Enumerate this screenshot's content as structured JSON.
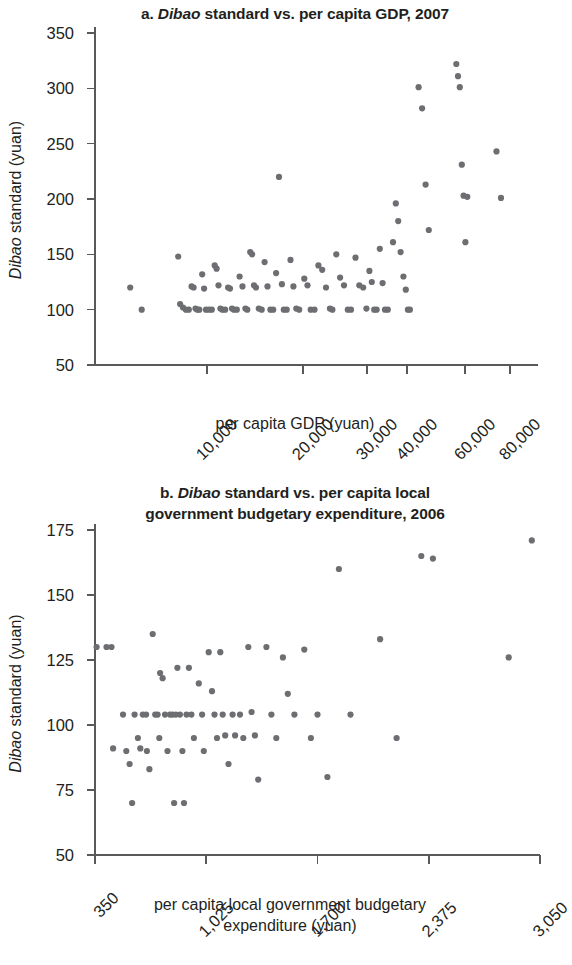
{
  "figure": {
    "background": "#ffffff",
    "marker_color": "#6d6e71",
    "axis_color": "#58595b",
    "text_color": "#231f20"
  },
  "panel_a": {
    "title_prefix": "a. ",
    "title_italic": "Dibao",
    "title_rest": " standard vs. per capita GDP, 2007",
    "title_full": "a. Dibao standard vs. per capita GDP, 2007",
    "y_axis_title_italic": "Dibao",
    "y_axis_title_rest": " standard (yuan)",
    "x_axis_title": "per capita GDP (yuan)"
  },
  "panel_b": {
    "title_prefix": "b. ",
    "title_italic": "Dibao",
    "title_rest_line1": " standard vs. per capita local",
    "title_line2": "government budgetary expenditure, 2006",
    "title_full": "b. Dibao standard vs. per capita local government budgetary expenditure, 2006",
    "y_axis_title_italic": "Dibao",
    "y_axis_title_rest": " standard (yuan)",
    "x_axis_title_line1": "per capita local government budgetary",
    "x_axis_title_line2": "expenditure (yuan)"
  },
  "chart_data": [
    {
      "id": "chart-a",
      "type": "scatter",
      "title": "a. Dibao standard vs. per capita GDP, 2007",
      "xlabel": "per capita GDP (yuan)",
      "ylabel": "Dibao standard (yuan)",
      "grid": false,
      "legend": "none",
      "ylim": [
        50,
        350
      ],
      "yticks": [
        50,
        100,
        150,
        200,
        250,
        300,
        350
      ],
      "xticks": [
        10000,
        20000,
        30000,
        40000,
        60000,
        80000
      ],
      "xtick_labels": [
        "10,000",
        "20,000",
        "30,000",
        "40,000",
        "60,000",
        "80,000"
      ],
      "xtick_pixels": [
        207,
        303,
        367,
        407,
        465,
        510
      ],
      "x_axis_note": "non-linear compressed axis; tick spacing decreases at high values",
      "points": [
        [
          2000,
          120
        ],
        [
          3200,
          100
        ],
        [
          7000,
          148
        ],
        [
          7200,
          105
        ],
        [
          7500,
          102
        ],
        [
          7800,
          100
        ],
        [
          8100,
          100
        ],
        [
          8400,
          121
        ],
        [
          8600,
          120
        ],
        [
          8800,
          101
        ],
        [
          9000,
          100
        ],
        [
          9200,
          100
        ],
        [
          9500,
          132
        ],
        [
          9700,
          119
        ],
        [
          9900,
          100
        ],
        [
          10200,
          100
        ],
        [
          10500,
          100
        ],
        [
          10800,
          140
        ],
        [
          11000,
          137
        ],
        [
          11200,
          122
        ],
        [
          11400,
          101
        ],
        [
          11600,
          100
        ],
        [
          11900,
          100
        ],
        [
          12200,
          120
        ],
        [
          12400,
          119
        ],
        [
          12600,
          101
        ],
        [
          12800,
          100
        ],
        [
          13100,
          100
        ],
        [
          13400,
          130
        ],
        [
          13700,
          121
        ],
        [
          14000,
          101
        ],
        [
          14200,
          100
        ],
        [
          14500,
          152
        ],
        [
          14700,
          150
        ],
        [
          14900,
          122
        ],
        [
          15100,
          120
        ],
        [
          15400,
          101
        ],
        [
          15700,
          100
        ],
        [
          16000,
          143
        ],
        [
          16300,
          121
        ],
        [
          16600,
          100
        ],
        [
          16900,
          100
        ],
        [
          17200,
          133
        ],
        [
          17500,
          220
        ],
        [
          17800,
          123
        ],
        [
          18000,
          100
        ],
        [
          18300,
          100
        ],
        [
          18700,
          145
        ],
        [
          19000,
          121
        ],
        [
          19300,
          101
        ],
        [
          19600,
          100
        ],
        [
          20200,
          128
        ],
        [
          20700,
          122
        ],
        [
          21200,
          100
        ],
        [
          21800,
          100
        ],
        [
          22400,
          140
        ],
        [
          23000,
          136
        ],
        [
          23600,
          120
        ],
        [
          24200,
          101
        ],
        [
          24600,
          100
        ],
        [
          25200,
          150
        ],
        [
          25800,
          129
        ],
        [
          26400,
          122
        ],
        [
          27000,
          100
        ],
        [
          27500,
          100
        ],
        [
          28200,
          147
        ],
        [
          28800,
          122
        ],
        [
          29400,
          120
        ],
        [
          29900,
          101
        ],
        [
          30600,
          135
        ],
        [
          31200,
          125
        ],
        [
          31800,
          100
        ],
        [
          32400,
          100
        ],
        [
          33200,
          155
        ],
        [
          33900,
          124
        ],
        [
          34500,
          100
        ],
        [
          35200,
          100
        ],
        [
          36500,
          161
        ],
        [
          37200,
          196
        ],
        [
          37800,
          180
        ],
        [
          38400,
          152
        ],
        [
          39100,
          130
        ],
        [
          39700,
          118
        ],
        [
          40300,
          100
        ],
        [
          41000,
          100
        ],
        [
          44000,
          301
        ],
        [
          45200,
          282
        ],
        [
          46400,
          213
        ],
        [
          47500,
          172
        ],
        [
          57000,
          322
        ],
        [
          57600,
          311
        ],
        [
          58200,
          301
        ],
        [
          58900,
          231
        ],
        [
          59500,
          203
        ],
        [
          60200,
          161
        ],
        [
          61000,
          202
        ],
        [
          74000,
          243
        ],
        [
          76000,
          201
        ]
      ]
    },
    {
      "id": "chart-b",
      "type": "scatter",
      "title": "b. Dibao standard vs. per capita local government budgetary expenditure, 2006",
      "xlabel": "per capita local government budgetary expenditure (yuan)",
      "ylabel": "Dibao standard (yuan)",
      "grid": false,
      "legend": "none",
      "ylim": [
        50,
        175
      ],
      "yticks": [
        50,
        75,
        100,
        125,
        150,
        175
      ],
      "xlim": [
        350,
        3050
      ],
      "xticks": [
        350,
        1025,
        1700,
        2375,
        3050
      ],
      "xtick_labels": [
        "350",
        "1,025",
        "1,700",
        "2,375",
        "3,050"
      ],
      "points": [
        [
          360,
          130
        ],
        [
          420,
          130
        ],
        [
          450,
          130
        ],
        [
          460,
          91
        ],
        [
          520,
          104
        ],
        [
          540,
          90
        ],
        [
          560,
          85
        ],
        [
          575,
          70
        ],
        [
          590,
          104
        ],
        [
          610,
          95
        ],
        [
          625,
          91
        ],
        [
          640,
          104
        ],
        [
          660,
          104
        ],
        [
          665,
          90
        ],
        [
          680,
          83
        ],
        [
          700,
          135
        ],
        [
          715,
          104
        ],
        [
          730,
          104
        ],
        [
          740,
          95
        ],
        [
          745,
          120
        ],
        [
          760,
          118
        ],
        [
          775,
          104
        ],
        [
          790,
          90
        ],
        [
          805,
          104
        ],
        [
          820,
          104
        ],
        [
          830,
          70
        ],
        [
          840,
          104
        ],
        [
          850,
          122
        ],
        [
          865,
          104
        ],
        [
          880,
          90
        ],
        [
          890,
          70
        ],
        [
          905,
          104
        ],
        [
          920,
          122
        ],
        [
          935,
          104
        ],
        [
          950,
          95
        ],
        [
          980,
          116
        ],
        [
          1000,
          104
        ],
        [
          1010,
          90
        ],
        [
          1040,
          128
        ],
        [
          1060,
          113
        ],
        [
          1075,
          104
        ],
        [
          1090,
          95
        ],
        [
          1110,
          128
        ],
        [
          1125,
          104
        ],
        [
          1140,
          96
        ],
        [
          1160,
          85
        ],
        [
          1185,
          104
        ],
        [
          1200,
          96
        ],
        [
          1230,
          104
        ],
        [
          1250,
          95
        ],
        [
          1280,
          130
        ],
        [
          1300,
          105
        ],
        [
          1320,
          96
        ],
        [
          1340,
          79
        ],
        [
          1390,
          130
        ],
        [
          1420,
          104
        ],
        [
          1450,
          95
        ],
        [
          1490,
          126
        ],
        [
          1520,
          112
        ],
        [
          1560,
          104
        ],
        [
          1620,
          129
        ],
        [
          1660,
          95
        ],
        [
          1700,
          104
        ],
        [
          1760,
          80
        ],
        [
          1830,
          160
        ],
        [
          1900,
          104
        ],
        [
          2080,
          133
        ],
        [
          2180,
          95
        ],
        [
          2330,
          165
        ],
        [
          2400,
          164
        ],
        [
          2860,
          126
        ],
        [
          3000,
          171
        ]
      ]
    }
  ]
}
